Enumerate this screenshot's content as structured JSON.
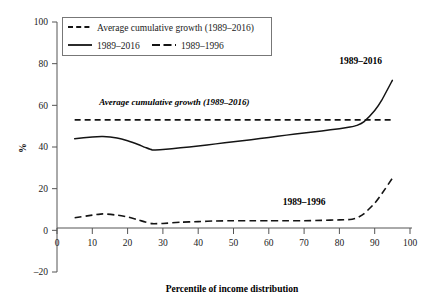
{
  "chart_data": {
    "type": "line",
    "title": "",
    "xlabel": "Percentile of income distribution",
    "ylabel": "%",
    "xlim": [
      0,
      100
    ],
    "ylim": [
      -20,
      100
    ],
    "xticks": [
      "0",
      "10",
      "20",
      "30",
      "40",
      "50",
      "60",
      "70",
      "80",
      "90",
      "100"
    ],
    "yticks": [
      "100",
      "80",
      "60",
      "40",
      "20",
      "0",
      "–20"
    ],
    "grid": false,
    "legend_position": "top-left-inside",
    "legend": [
      {
        "label": "Average cumulative growth (1989–2016)",
        "style": "dashed"
      },
      {
        "label": "1989–2016",
        "style": "solid"
      },
      {
        "label": "1989–1996",
        "style": "dashed-long"
      }
    ],
    "annotations": [
      {
        "text": "Average cumulative growth (1989–2016)",
        "x": 12,
        "y": 60,
        "style": "bold-italic"
      },
      {
        "text": "1989–2016",
        "x": 86,
        "y": 80,
        "style": "bold"
      },
      {
        "text": "1989–1996",
        "x": 70,
        "y": 12,
        "style": "bold"
      }
    ],
    "x": [
      5,
      10,
      13,
      17,
      20,
      23,
      25,
      27,
      30,
      35,
      40,
      45,
      50,
      55,
      60,
      65,
      70,
      75,
      80,
      83,
      85,
      87,
      90,
      92,
      95
    ],
    "series": [
      {
        "name": "1989–2016",
        "style": "solid",
        "values": [
          44.0,
          44.8,
          45.0,
          44.3,
          43.0,
          41.2,
          39.8,
          38.6,
          38.8,
          39.6,
          40.5,
          41.5,
          42.5,
          43.5,
          44.6,
          45.7,
          46.7,
          47.7,
          48.8,
          49.6,
          50.4,
          52.2,
          57.5,
          62.5,
          72.0
        ]
      },
      {
        "name": "1989–1996",
        "style": "dashed-long",
        "values": [
          6.0,
          7.3,
          7.9,
          7.3,
          6.4,
          5.0,
          4.0,
          3.2,
          3.3,
          3.9,
          4.2,
          4.5,
          4.6,
          4.6,
          4.6,
          4.6,
          4.6,
          4.8,
          5.0,
          5.2,
          6.0,
          8.0,
          13.0,
          17.5,
          25.0
        ]
      },
      {
        "name": "Average cumulative growth (1989–2016)",
        "style": "dashed",
        "constant": 53.0,
        "x_range": [
          5,
          95
        ]
      }
    ]
  }
}
